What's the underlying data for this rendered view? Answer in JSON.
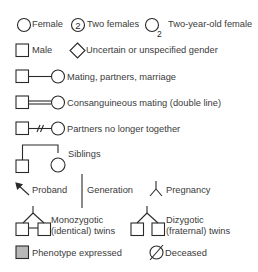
{
  "legend": {
    "row1": {
      "female": "Female",
      "two_females_count": "2",
      "two_females": "Two females",
      "age_subscript": "2",
      "two_year_old_female": "Two-year-old female"
    },
    "row2": {
      "male": "Male",
      "uncertain": "Uncertain or unspecified gender"
    },
    "mating": "Mating, partners, marriage",
    "consanguineous": "Consanguineous mating (double line)",
    "separated": "Partners no longer together",
    "siblings": "Siblings",
    "row7": {
      "proband": "Proband",
      "generation": "Generation",
      "pregnancy": "Pregnancy"
    },
    "twins": {
      "monozygotic_line1": "Monozygotic",
      "monozygotic_line2": "(identical) twins",
      "dizygotic_line1": "Dizygotic",
      "dizygotic_line2": "(fraternal) twins"
    },
    "row9": {
      "phenotype": "Phenotype expressed",
      "deceased": "Deceased"
    }
  },
  "colors": {
    "stroke": "#2a2a2a",
    "phenotype_fill": "#b8b8b8",
    "text": "#3a3a3a",
    "background": "#ffffff"
  }
}
